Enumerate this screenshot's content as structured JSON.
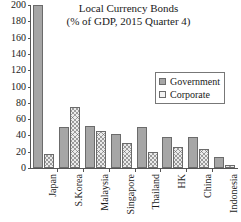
{
  "chart_data": {
    "type": "bar",
    "title": "Local Currency Bonds",
    "subtitle": "(% of GDP, 2015 Quarter 4)",
    "xlabel": "",
    "ylabel": "",
    "ylim": [
      0,
      200
    ],
    "ytick_values": [
      200,
      180,
      160,
      140,
      120,
      100,
      80,
      60,
      40,
      20,
      0
    ],
    "ytick_labels": [
      "200",
      "180",
      "160",
      "140",
      "120",
      "100",
      "80",
      "60",
      "40",
      "20",
      "0"
    ],
    "grid": false,
    "legend_position": "upper right",
    "categories": [
      "Japan",
      "S.Korea",
      "Malaysia",
      "Singapore",
      "Thailand",
      "HK",
      "China",
      "Indonesia"
    ],
    "series": [
      {
        "name": "Government",
        "color": "#a6a6a6",
        "values": [
          200,
          50,
          52,
          42,
          50,
          38,
          38,
          14
        ]
      },
      {
        "name": "Corporate",
        "color": "#ebebeb",
        "values": [
          17,
          75,
          45,
          31,
          20,
          26,
          23,
          4
        ]
      }
    ]
  },
  "legend": {
    "items": [
      {
        "label": "Government",
        "swatch": "filled-gray-square"
      },
      {
        "label": "Corporate",
        "swatch": "hatched-square"
      }
    ]
  }
}
